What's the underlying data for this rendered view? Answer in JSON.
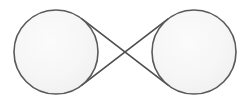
{
  "figure": {
    "width": 250,
    "height": 103,
    "background_color": "#ffffff"
  },
  "style": {
    "stroke_color": "#59595b",
    "stroke_width": 1.6,
    "pulley_fill": "#f5f5f5",
    "pulley_fill_highlight": "#fafafa",
    "belt_stroke_color": "#4f4f51",
    "belt_stroke_width": 1.7
  },
  "shapes": {
    "left_pulley": {
      "label": "left-pulley",
      "cx": 56,
      "cy": 52,
      "r": 42
    },
    "right_pulley": {
      "label": "right-pulley",
      "cx": 194,
      "cy": 52,
      "r": 42
    },
    "crossing_point": {
      "label": "belt-crossing-point",
      "x": 125,
      "y": 52
    },
    "belt_upper": {
      "label": "belt-segment-upper",
      "path": "M 72.75 14.95 L 177.25 89.05"
    },
    "belt_lower": {
      "label": "belt-segment-lower",
      "path": "M 72.75 89.05 L 177.25 14.95"
    }
  },
  "geometry_notes": {
    "center_distance": 138,
    "pulley_diameter": 84,
    "belt_type": "crossed"
  }
}
